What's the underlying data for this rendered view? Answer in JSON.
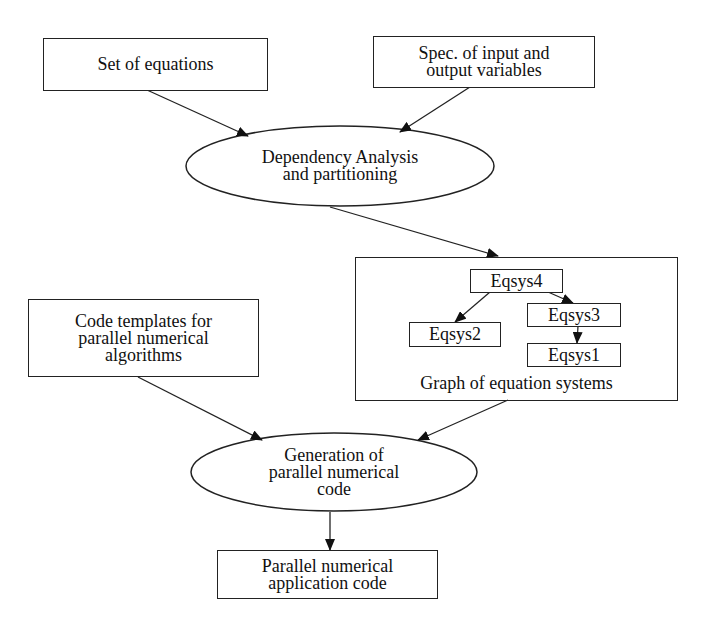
{
  "diagram": {
    "nodes": {
      "set_of_equations": {
        "label": "Set of equations",
        "shape": "rectangle"
      },
      "spec_io": {
        "label": "Spec. of input and\noutput variables",
        "shape": "rectangle"
      },
      "dependency_analysis": {
        "label": "Dependency Analysis\nand partitioning",
        "shape": "ellipse"
      },
      "graph_container": {
        "label": "Graph of equation systems",
        "shape": "rectangle"
      },
      "eqsys4": {
        "label": "Eqsys4",
        "shape": "rectangle"
      },
      "eqsys3": {
        "label": "Eqsys3",
        "shape": "rectangle"
      },
      "eqsys2": {
        "label": "Eqsys2",
        "shape": "rectangle"
      },
      "eqsys1": {
        "label": "Eqsys1",
        "shape": "rectangle"
      },
      "code_templates": {
        "label": "Code templates for\nparallel numerical\nalgorithms",
        "shape": "rectangle"
      },
      "generation": {
        "label": "Generation of\nparallel numerical\ncode",
        "shape": "ellipse"
      },
      "output_code": {
        "label": "Parallel numerical\napplication code",
        "shape": "rectangle"
      }
    },
    "edges": [
      {
        "from": "Set of equations",
        "to": "Dependency Analysis and partitioning"
      },
      {
        "from": "Spec. of input and output variables",
        "to": "Dependency Analysis and partitioning"
      },
      {
        "from": "Dependency Analysis and partitioning",
        "to": "Graph of equation systems"
      },
      {
        "from": "Eqsys4",
        "to": "Eqsys2"
      },
      {
        "from": "Eqsys4",
        "to": "Eqsys3"
      },
      {
        "from": "Eqsys3",
        "to": "Eqsys1"
      },
      {
        "from": "Code templates for parallel numerical algorithms",
        "to": "Generation of parallel numerical code"
      },
      {
        "from": "Graph of equation systems",
        "to": "Generation of parallel numerical code"
      },
      {
        "from": "Generation of parallel numerical code",
        "to": "Parallel numerical application code"
      }
    ]
  }
}
